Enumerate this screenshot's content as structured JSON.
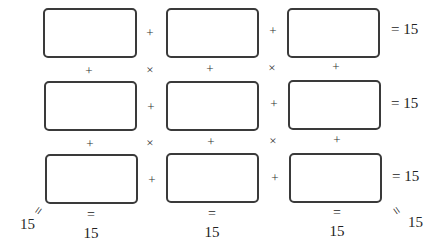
{
  "puzzle": {
    "type": "magic-square-3x3",
    "target": "15",
    "cells": [
      [
        "",
        "",
        ""
      ],
      [
        "",
        "",
        ""
      ],
      [
        "",
        "",
        ""
      ]
    ],
    "row_operators": [
      "+",
      "+"
    ],
    "col_operators": [
      "+",
      "+"
    ],
    "diagonal_operators": [
      "×",
      "×",
      "×",
      "×"
    ],
    "row_sums": [
      {
        "eq": "=",
        "value": "15",
        "label": "= 15"
      },
      {
        "eq": "=",
        "value": "15",
        "label": "= 15"
      },
      {
        "eq": "=",
        "value": "15",
        "label": "= 15"
      }
    ],
    "col_sums": [
      {
        "eq": "=",
        "value": "15"
      },
      {
        "eq": "=",
        "value": "15"
      },
      {
        "eq": "=",
        "value": "15"
      }
    ],
    "diagonal_sums": {
      "anti_diagonal": {
        "eq": "=",
        "value": "15"
      },
      "main_diagonal": {
        "eq": "=",
        "value": "15"
      }
    }
  }
}
